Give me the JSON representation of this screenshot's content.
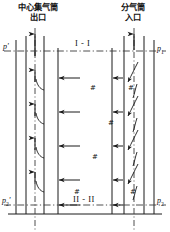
{
  "figure": {
    "kind": "gas-vessel-flow-diagram",
    "stroke_color": "#1a1a1a",
    "background": "#ffffff"
  },
  "annotations": {
    "left_header_line1": "中心集气筒",
    "left_header_line2": "出口",
    "right_header_line1": "分气筒",
    "right_header_line2": "入口"
  },
  "section_labels": {
    "top": "I - I",
    "bottom": "II - II"
  },
  "pressure_labels": {
    "top_left": "p'",
    "top_right_base": "p",
    "top_right_sub": "1",
    "bottom_left_base": "p",
    "bottom_left_sub": "2",
    "bottom_left_prime": "'",
    "bottom_right_base": "p",
    "bottom_right_sub": "2"
  },
  "hash_marks": {
    "glyph": "#",
    "positions": [
      {
        "x": 90,
        "y": 84
      },
      {
        "x": 128,
        "y": 84
      },
      {
        "x": 108,
        "y": 119
      },
      {
        "x": 92,
        "y": 153
      },
      {
        "x": 130,
        "y": 188
      },
      {
        "x": 74,
        "y": 188
      }
    ]
  },
  "flow": {
    "outlet_arrow_direction": "up",
    "inlet_arrow_direction": "down",
    "cross_arrow_direction": "left",
    "cross_arrow_rows": [
      78,
      112,
      146,
      180,
      205
    ],
    "curve_count_per_side": 4
  }
}
